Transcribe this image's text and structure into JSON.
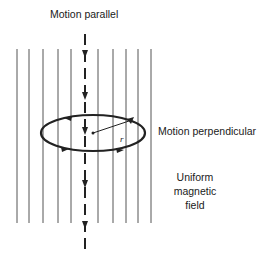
{
  "labels": {
    "top": "Motion parallel",
    "right": "Motion perpendicular",
    "field_line1": "Uniform",
    "field_line2": "magnetic",
    "field_line3": "field",
    "radius": "r"
  },
  "geometry": {
    "field_lines_x": [
      17,
      29,
      43,
      58,
      71,
      98,
      113,
      126,
      138,
      151
    ],
    "field_line_top": 49,
    "field_line_bottom": 223,
    "axis_x": 85,
    "axis_top": 34,
    "axis_bottom": 253,
    "ellipse": {
      "cx": 93,
      "cy": 133,
      "rx": 52,
      "ry": 18
    }
  },
  "colors": {
    "line": "#333333",
    "field_line": "#555555",
    "background": "#ffffff"
  }
}
